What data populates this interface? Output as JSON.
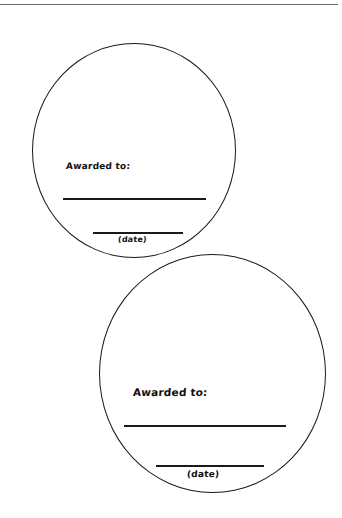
{
  "page": {
    "top_rule": true
  },
  "badges": [
    {
      "awarded_label": "Awarded to:",
      "date_label": "(date)"
    },
    {
      "awarded_label": "Awarded to:",
      "date_label": "(date)"
    }
  ],
  "colors": {
    "ink": "#1a1a1a",
    "rule": "#6e6e6e",
    "background": "#ffffff"
  }
}
